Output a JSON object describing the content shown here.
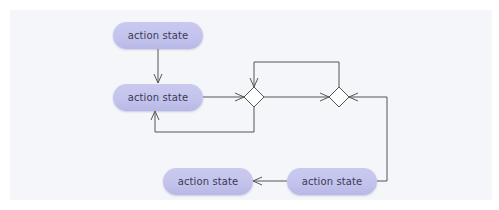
{
  "diagram": {
    "type": "UML activity diagram",
    "colors": {
      "background_panel": "#f4f6f9",
      "action_state_fill": "#c4c4ee",
      "action_state_text": "#3b3b55",
      "connector": "#555555",
      "decision_fill": "#ffffff"
    },
    "nodes": [
      {
        "id": "action1",
        "kind": "action-state",
        "label": "action state"
      },
      {
        "id": "action2",
        "kind": "action-state",
        "label": "action state"
      },
      {
        "id": "decision1",
        "kind": "decision-diamond",
        "label": ""
      },
      {
        "id": "decision2",
        "kind": "decision-diamond",
        "label": ""
      },
      {
        "id": "action3",
        "kind": "action-state",
        "label": "action state"
      },
      {
        "id": "action4",
        "kind": "action-state",
        "label": "action state"
      }
    ],
    "edges": [
      {
        "from": "action1",
        "to": "action2"
      },
      {
        "from": "action2",
        "to": "decision1"
      },
      {
        "from": "decision1",
        "to": "action2"
      },
      {
        "from": "decision1",
        "to": "decision2"
      },
      {
        "from": "decision2",
        "to": "decision1"
      },
      {
        "from": "action4",
        "to": "decision2"
      },
      {
        "from": "action4",
        "to": "action3"
      }
    ]
  }
}
